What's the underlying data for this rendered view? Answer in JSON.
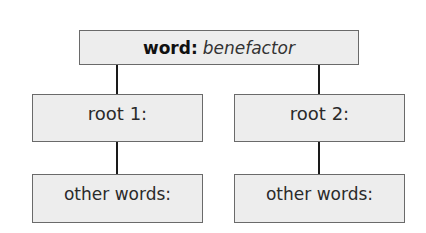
{
  "diagram": {
    "top": {
      "label": "word:",
      "value": "benefactor"
    },
    "roots": [
      {
        "label": "root 1:",
        "child": "other words:"
      },
      {
        "label": "root 2:",
        "child": "other words:"
      }
    ]
  }
}
